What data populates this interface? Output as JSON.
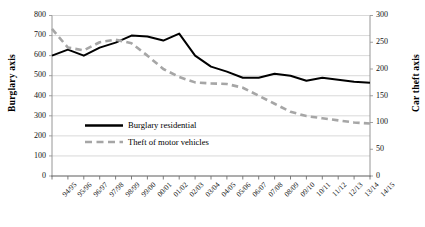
{
  "chart_data": {
    "type": "line",
    "title": "",
    "xlabel": "",
    "ylabel": "Burglary axis",
    "y2label": "Car theft axis",
    "grid": true,
    "legend_position": "center-left-inside",
    "categories": [
      "94/95",
      "95/96",
      "96/97",
      "97/98",
      "98/99",
      "99/00",
      "00/01",
      "01/02",
      "02/03",
      "03/04",
      "04/05",
      "05/06",
      "06/07",
      "07/08",
      "08/09",
      "09/10",
      "10/11",
      "11/12",
      "12/13",
      "13/14",
      "14/15"
    ],
    "ylim": [
      0,
      800
    ],
    "yticks": [
      0,
      100,
      200,
      300,
      400,
      500,
      600,
      700,
      800
    ],
    "y2lim": [
      0,
      300
    ],
    "y2ticks": [
      0,
      50,
      100,
      150,
      200,
      250,
      300
    ],
    "series": [
      {
        "name": "Burglary residential",
        "axis": "left",
        "color": "#000000",
        "style": "solid",
        "values": [
          600,
          630,
          600,
          640,
          665,
          700,
          695,
          675,
          710,
          600,
          545,
          520,
          490,
          490,
          510,
          500,
          475,
          490,
          480,
          470,
          465
        ]
      },
      {
        "name": "Theft of motor vehicles",
        "axis": "right",
        "color": "#a6a6a6",
        "style": "dashed",
        "values": [
          275,
          240,
          235,
          250,
          255,
          248,
          225,
          200,
          185,
          175,
          173,
          172,
          165,
          150,
          135,
          120,
          112,
          108,
          104,
          100,
          98
        ]
      }
    ]
  },
  "legend": {
    "items": [
      {
        "label": "Burglary residential",
        "color": "#000000",
        "style": "solid"
      },
      {
        "label": "Theft of motor vehicles",
        "color": "#a6a6a6",
        "style": "dashed"
      }
    ]
  }
}
